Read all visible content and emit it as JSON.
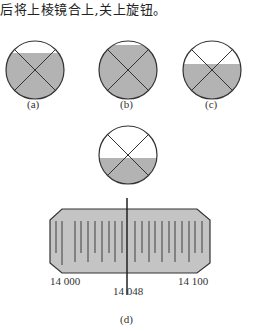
{
  "text": {
    "intro_line": "后将上棱镜合上,关上旋钮。"
  },
  "figures": {
    "a": {
      "label": "(a)",
      "fill_level": "middle"
    },
    "b": {
      "label": "(b)",
      "fill_level": "high"
    },
    "c": {
      "label": "(c)",
      "fill_level": "low"
    },
    "d": {
      "label": "(d)",
      "scale_left": "14 000",
      "scale_right": "14 100",
      "scale_reading": "14 048"
    }
  },
  "colors": {
    "fill": "#b3b3b3",
    "stroke": "#333333",
    "scale_bg": "#c4c4c4"
  }
}
